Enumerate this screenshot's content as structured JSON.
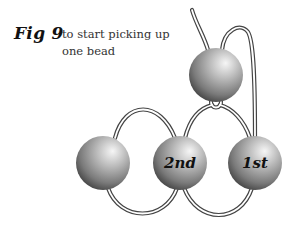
{
  "figure": {
    "number_label": "Fig 9",
    "caption_lines": [
      "to start picking up",
      "one bead"
    ]
  },
  "beads": [
    {
      "id": "top",
      "label": "",
      "cx": 216,
      "cy": 75,
      "r": 27
    },
    {
      "id": "left",
      "label": "",
      "cx": 103,
      "cy": 163,
      "r": 27
    },
    {
      "id": "second",
      "label": "2nd",
      "cx": 180,
      "cy": 163,
      "r": 27
    },
    {
      "id": "first",
      "label": "1st",
      "cx": 255,
      "cy": 163,
      "r": 27
    }
  ],
  "colors": {
    "thread": "#444444",
    "bead_highlight": "#f4f4f4",
    "bead_mid": "#a8a8a8",
    "bead_shadow": "#4a4a4a"
  }
}
